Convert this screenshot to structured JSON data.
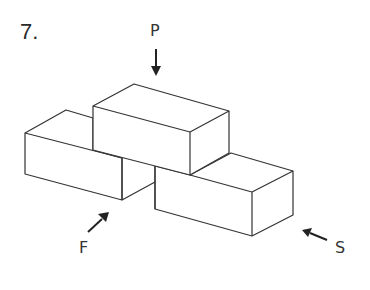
{
  "problem": {
    "number": "7."
  },
  "labels": {
    "top": "P",
    "front": "F",
    "side": "S"
  },
  "diagram": {
    "stroke_color": "#333333",
    "arrow_color": "#222222"
  }
}
